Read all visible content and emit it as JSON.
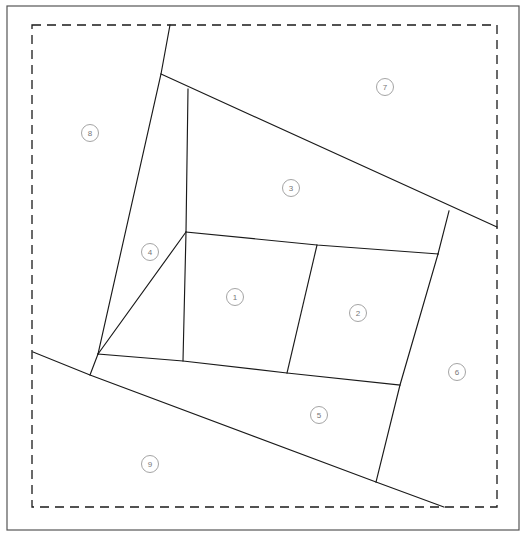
{
  "diagram": {
    "canvas": {
      "width": 528,
      "height": 543
    },
    "colors": {
      "background": "#ffffff",
      "parcel_line": "#1a1a1a",
      "outer_border": "#555555",
      "dashed_boundary": "#1a1a1a",
      "label_text": "#777777",
      "label_ring": "#9a9a9a"
    },
    "outer_border": {
      "x": 7,
      "y": 6,
      "width": 512,
      "height": 524
    },
    "dashed_boundary": {
      "x": 32,
      "y": 25,
      "width": 465,
      "height": 482
    },
    "regions": [
      {
        "id": "1",
        "label": "1",
        "cx": 235,
        "cy": 297,
        "r": 8.5
      },
      {
        "id": "2",
        "label": "2",
        "cx": 358,
        "cy": 313,
        "r": 8.5
      },
      {
        "id": "3",
        "label": "3",
        "cx": 291,
        "cy": 188,
        "r": 8.5
      },
      {
        "id": "4",
        "label": "4",
        "cx": 150,
        "cy": 252,
        "r": 8.5
      },
      {
        "id": "5",
        "label": "5",
        "cx": 319,
        "cy": 415,
        "r": 8.5
      },
      {
        "id": "6",
        "label": "6",
        "cx": 457,
        "cy": 372,
        "r": 8.5
      },
      {
        "id": "7",
        "label": "7",
        "cx": 385,
        "cy": 87,
        "r": 8.5
      },
      {
        "id": "8",
        "label": "8",
        "cx": 90,
        "cy": 133,
        "r": 8.5
      },
      {
        "id": "9",
        "label": "9",
        "cx": 150,
        "cy": 464,
        "r": 8.5
      }
    ],
    "parcel_paths": [
      {
        "name": "boundary-northwest-ridge",
        "d": "M 170 25 L 161 74 L 98 354"
      },
      {
        "name": "boundary-north-to-east",
        "d": "M 161 74 L 497 227"
      },
      {
        "name": "boundary-region3-south",
        "d": "M 186 232 L 449 211"
      },
      {
        "name": "boundary-region4-east",
        "d": "M 188 89 L 186 232 L 183 361"
      },
      {
        "name": "boundary-mid-horizontal",
        "d": "M 98 354 L 186 232"
      },
      {
        "name": "boundary-one-two-divider",
        "d": "M 317 245 L 287 373"
      },
      {
        "name": "boundary-east-vertical",
        "d": "M 449 211 L 438 254 L 400 385 L 376 482"
      },
      {
        "name": "boundary-region1-top",
        "d": "M 186 232 L 317 245 L 438 254"
      },
      {
        "name": "boundary-region5-top",
        "d": "M 98 354 L 183 361 L 287 373 L 400 385"
      },
      {
        "name": "boundary-southwest-diagonal",
        "d": "M 33 352 L 90 375 L 376 482 L 444 507"
      },
      {
        "name": "boundary-region4-lower-left",
        "d": "M 98 354 L 90 375"
      }
    ]
  }
}
